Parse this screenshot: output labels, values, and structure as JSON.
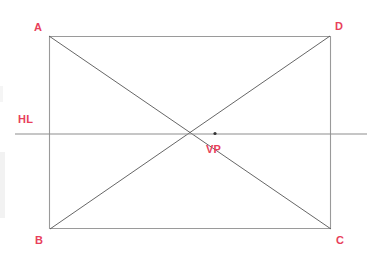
{
  "diagram": {
    "canvas": {
      "width": 381,
      "height": 258,
      "background": "#ffffff"
    },
    "colors": {
      "label_red": "#e8405a",
      "rectangle_stroke": "#9a9a9a",
      "diagonal_stroke": "#555555",
      "horizon_stroke": "#8d8d8d",
      "vanishing_point_dot": "#333333"
    },
    "rectangle": {
      "name": "picture-plane-rectangle",
      "corners": {
        "A": {
          "x": 49,
          "y": 36
        },
        "D": {
          "x": 330,
          "y": 36
        },
        "C": {
          "x": 331,
          "y": 229
        },
        "B": {
          "x": 50,
          "y": 229
        }
      },
      "stroke_width": 1
    },
    "diagonals": [
      {
        "name": "diagonal-a-to-c",
        "from": "A",
        "to": "C",
        "x1": 49,
        "y1": 36,
        "x2": 331,
        "y2": 229
      },
      {
        "name": "diagonal-b-to-d",
        "from": "B",
        "to": "D",
        "x1": 50,
        "y1": 229,
        "x2": 330,
        "y2": 36
      }
    ],
    "horizon_line": {
      "name": "horizon-line",
      "label": "HL",
      "x1": 15,
      "y1": 134,
      "x2": 367,
      "y2": 134,
      "stroke_width": 1
    },
    "vanishing_point": {
      "name": "vanishing-point",
      "label": "VP",
      "x": 215,
      "y": 133
    },
    "labels": [
      {
        "id": "A",
        "text": "A",
        "x": 34,
        "y": 22
      },
      {
        "id": "D",
        "text": "D",
        "x": 335,
        "y": 21
      },
      {
        "id": "B",
        "text": "B",
        "x": 35,
        "y": 235
      },
      {
        "id": "C",
        "text": "C",
        "x": 336,
        "y": 235
      },
      {
        "id": "HL",
        "text": "HL",
        "x": 18,
        "y": 114
      },
      {
        "id": "VP",
        "text": "VP",
        "x": 206,
        "y": 144
      }
    ]
  }
}
